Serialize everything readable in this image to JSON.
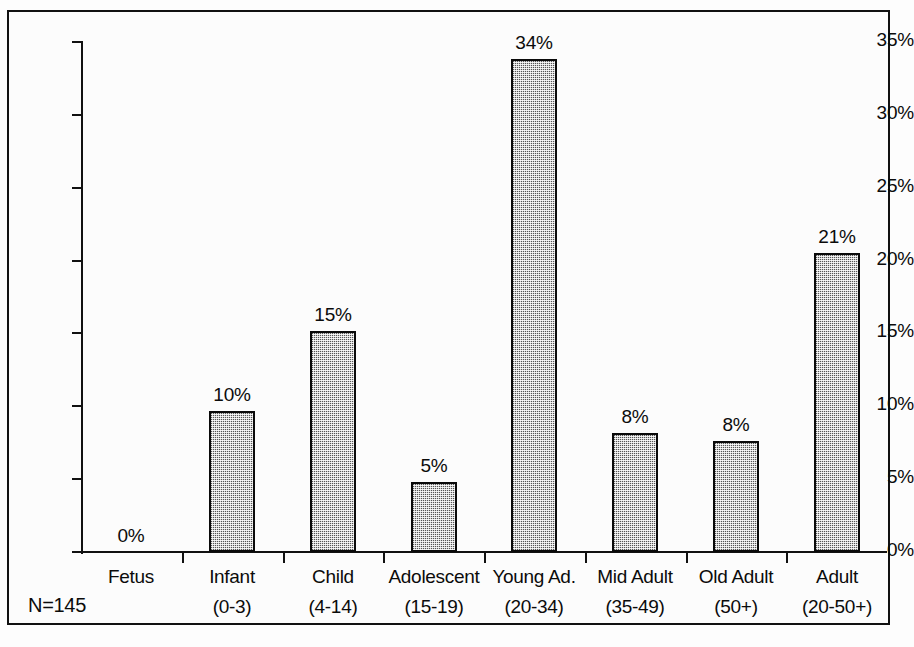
{
  "chart_data": {
    "type": "bar",
    "title": "",
    "xlabel": "",
    "ylabel": "",
    "ylim": [
      0,
      35
    ],
    "ytick_labels": [
      "0%",
      "5%",
      "10%",
      "15%",
      "20%",
      "25%",
      "30%",
      "35%"
    ],
    "ytick_values": [
      0,
      5,
      10,
      15,
      20,
      25,
      30,
      35
    ],
    "grid": false,
    "legend": "none",
    "categories": [
      "Fetus",
      "Infant",
      "Child",
      "Adolescent",
      "Young Ad.",
      "Mid Adult",
      "Old Adult",
      "Adult"
    ],
    "category_ranges": [
      "",
      "(0-3)",
      "(4-14)",
      "(15-19)",
      "(20-34)",
      "(35-49)",
      "(50+)",
      "(20-50+)"
    ],
    "values": [
      0,
      9.7,
      15.2,
      4.8,
      33.8,
      8.2,
      7.6,
      20.5
    ],
    "data_labels": [
      "0%",
      "10%",
      "15%",
      "5%",
      "34%",
      "8%",
      "8%",
      "21%"
    ],
    "annotation": "N=145",
    "colors": {
      "bar_fill": "#a9a9a9",
      "bar_outline": "#0a0a0a",
      "axis": "#111111",
      "text": "#0b0b0b",
      "background": "#fcfcfc"
    }
  },
  "bars": [
    {
      "label": "Fetus",
      "range": "",
      "value": 0,
      "data_label": "0%"
    },
    {
      "label": "Infant",
      "range": "(0-3)",
      "value": 9.7,
      "data_label": "10%"
    },
    {
      "label": "Child",
      "range": "(4-14)",
      "value": 15.2,
      "data_label": "15%"
    },
    {
      "label": "Adolescent",
      "range": "(15-19)",
      "value": 4.8,
      "data_label": "5%"
    },
    {
      "label": "Young Ad.",
      "range": "(20-34)",
      "value": 33.8,
      "data_label": "34%"
    },
    {
      "label": "Mid Adult",
      "range": "(35-49)",
      "value": 8.2,
      "data_label": "8%"
    },
    {
      "label": "Old Adult",
      "range": "(50+)",
      "value": 7.6,
      "data_label": "8%"
    },
    {
      "label": "Adult",
      "range": "(20-50+)",
      "value": 20.5,
      "data_label": "21%"
    }
  ],
  "axis": {
    "y_labels": [
      "35%",
      "30%",
      "25%",
      "20%",
      "15%",
      "10%",
      "5%",
      "0%"
    ]
  },
  "footer": {
    "sample_size": "N=145"
  }
}
